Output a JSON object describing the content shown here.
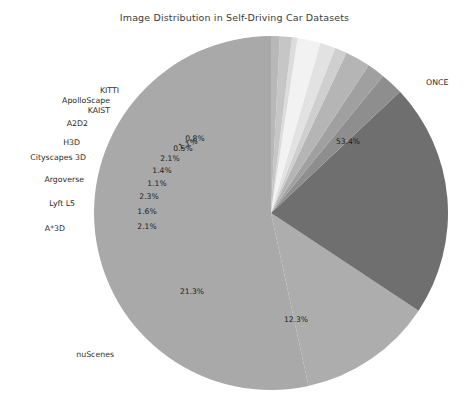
{
  "chart_data": {
    "type": "pie",
    "title": "Image Distribution in Self-Driving Car Datasets",
    "xlabel": "",
    "ylabel": "",
    "legend": "none",
    "grid": false,
    "startangle": 90,
    "counterclock": true,
    "categories": [
      "ONCE",
      "nuScenes",
      "A*3D",
      "Lyft L5",
      "Argoverse",
      "Cityscapes 3D",
      "H3D",
      "A2D2",
      "KAIST",
      "ApolloScape",
      "KITTI",
      ""
    ],
    "values": [
      53.4,
      21.3,
      2.1,
      1.6,
      2.3,
      1.1,
      1.4,
      2.1,
      0.5,
      1.1,
      0.8,
      12.3
    ],
    "slices": [
      {
        "name": "ONCE",
        "pct": 53.4,
        "pct_label": "53.4%",
        "color": "#a9a9a9",
        "show_name": true
      },
      {
        "name": "",
        "pct": 12.3,
        "pct_label": "12.3%",
        "color": "#adadad",
        "show_name": false
      },
      {
        "name": "nuScenes",
        "pct": 21.3,
        "pct_label": "21.3%",
        "color": "#6f6f6f",
        "show_name": true
      },
      {
        "name": "A*3D",
        "pct": 2.1,
        "pct_label": "2.1%",
        "color": "#8e8e8e",
        "show_name": true
      },
      {
        "name": "Lyft L5",
        "pct": 1.6,
        "pct_label": "1.6%",
        "color": "#a0a0a0",
        "show_name": true
      },
      {
        "name": "Argoverse",
        "pct": 2.3,
        "pct_label": "2.3%",
        "color": "#b5b5b5",
        "show_name": true
      },
      {
        "name": "Cityscapes 3D",
        "pct": 1.1,
        "pct_label": "1.1%",
        "color": "#cfcfcf",
        "show_name": true
      },
      {
        "name": "H3D",
        "pct": 1.4,
        "pct_label": "1.4%",
        "color": "#e2e2e2",
        "show_name": true
      },
      {
        "name": "A2D2",
        "pct": 2.1,
        "pct_label": "2.1%",
        "color": "#f2f2f2",
        "show_name": true
      },
      {
        "name": "KAIST",
        "pct": 0.5,
        "pct_label": "0.5%",
        "color": "#dcdcdc",
        "show_name": true
      },
      {
        "name": "ApolloScape",
        "pct": 1.1,
        "pct_label": "1.1%",
        "color": "#c6c6c6",
        "show_name": true
      },
      {
        "name": "KITTI",
        "pct": 0.8,
        "pct_label": "0.8%",
        "color": "#b8b8b8",
        "show_name": true
      }
    ],
    "geometry": {
      "cx": 271,
      "cy": 213,
      "r": 177
    },
    "colors": {
      "background": "#ffffff",
      "text": "#2b2b2b",
      "title": "#3a3a3a"
    },
    "label_overrides": {
      "pct": [
        {
          "name": "ONCE",
          "x": 348,
          "y": 141
        },
        {
          "name": "",
          "x": 296,
          "y": 319
        },
        {
          "name": "nuScenes",
          "x": 192,
          "y": 291
        },
        {
          "name": "A*3D",
          "x": 147,
          "y": 226
        },
        {
          "name": "Lyft L5",
          "x": 147,
          "y": 211
        },
        {
          "name": "Argoverse",
          "x": 149,
          "y": 196
        },
        {
          "name": "Cityscapes 3D",
          "x": 157,
          "y": 183
        },
        {
          "name": "H3D",
          "x": 162,
          "y": 170
        },
        {
          "name": "A2D2",
          "x": 170,
          "y": 158
        },
        {
          "name": "KAIST",
          "x": 183,
          "y": 148
        },
        {
          "name": "ApolloScape",
          "x": 188,
          "y": 144,
          "rot": -20
        },
        {
          "name": "KITTI",
          "x": 195,
          "y": 138
        }
      ],
      "cat": [
        {
          "name": "ONCE",
          "x": 426,
          "y": 82,
          "anchor": "start"
        },
        {
          "name": "nuScenes",
          "x": 114,
          "y": 354,
          "anchor": "end"
        },
        {
          "name": "A*3D",
          "x": 65,
          "y": 228,
          "anchor": "end"
        },
        {
          "name": "Lyft L5",
          "x": 75,
          "y": 203,
          "anchor": "end"
        },
        {
          "name": "Argoverse",
          "x": 84,
          "y": 179,
          "anchor": "end"
        },
        {
          "name": "Cityscapes 3D",
          "x": 86,
          "y": 157,
          "anchor": "end"
        },
        {
          "name": "H3D",
          "x": 80,
          "y": 142,
          "anchor": "end"
        },
        {
          "name": "A2D2",
          "x": 88,
          "y": 123,
          "anchor": "end"
        },
        {
          "name": "KAIST",
          "x": 110,
          "y": 110,
          "anchor": "end"
        },
        {
          "name": "ApolloScape",
          "x": 110,
          "y": 100,
          "anchor": "end"
        },
        {
          "name": "KITTI",
          "x": 119,
          "y": 90,
          "anchor": "end"
        }
      ]
    }
  }
}
